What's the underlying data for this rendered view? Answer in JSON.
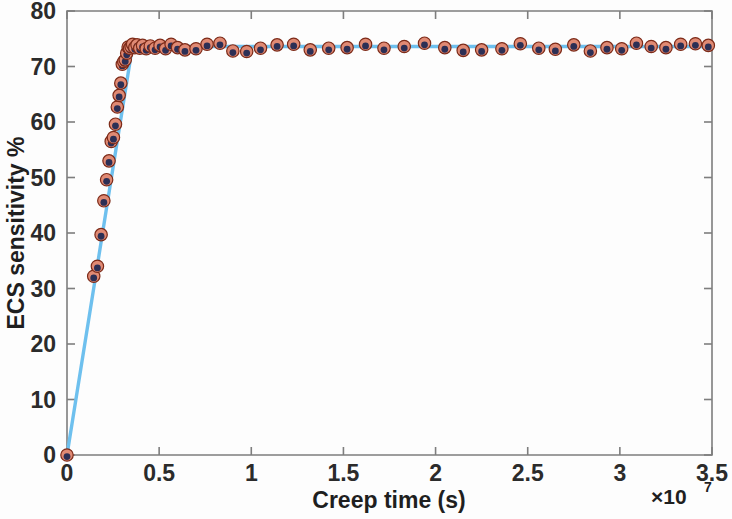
{
  "chart_data": {
    "type": "scatter",
    "title": "",
    "xlabel": "Creep time (s)",
    "ylabel": "ECS sensitivity %",
    "x_exponent_label": "×10",
    "x_exponent_value": "7",
    "x_multiplier": 10000000.0,
    "xlim": [
      0,
      3.5
    ],
    "ylim": [
      0,
      80
    ],
    "xticks": [
      0,
      0.5,
      1,
      1.5,
      2,
      2.5,
      3,
      3.5
    ],
    "xticklabels": [
      "0",
      "0.5",
      "1",
      "1.5",
      "2",
      "2.5",
      "3",
      "3.5"
    ],
    "yticks": [
      0,
      10,
      20,
      30,
      40,
      50,
      60,
      70,
      80
    ],
    "yticklabels": [
      "0",
      "10",
      "20",
      "30",
      "40",
      "50",
      "60",
      "70",
      "80"
    ],
    "grid": false,
    "legend": null,
    "colors": {
      "line": "#6ec0ee",
      "marker_outer": "#e08a74",
      "marker_outer_edge": "#7c2a18",
      "marker_inner": "#2c2f55",
      "axis": "#7e7e7e",
      "text": "#1f1f1f",
      "background": "#fdfdfd"
    },
    "series": [
      {
        "name": "ECS sensitivity vs creep time",
        "marker": "circle",
        "x": [
          0.0,
          0.145,
          0.165,
          0.185,
          0.2,
          0.215,
          0.228,
          0.24,
          0.252,
          0.263,
          0.273,
          0.283,
          0.292,
          0.3,
          0.308,
          0.316,
          0.324,
          0.332,
          0.34,
          0.348,
          0.356,
          0.368,
          0.38,
          0.395,
          0.41,
          0.43,
          0.452,
          0.478,
          0.505,
          0.535,
          0.565,
          0.6,
          0.64,
          0.7,
          0.76,
          0.83,
          0.9,
          0.975,
          1.05,
          1.14,
          1.23,
          1.32,
          1.42,
          1.52,
          1.62,
          1.72,
          1.83,
          1.94,
          2.05,
          2.15,
          2.25,
          2.36,
          2.46,
          2.56,
          2.65,
          2.75,
          2.84,
          2.93,
          3.01,
          3.09,
          3.17,
          3.25,
          3.33,
          3.41,
          3.48
        ],
        "y": [
          0.0,
          32.2,
          34.0,
          39.7,
          45.8,
          49.6,
          53.0,
          56.5,
          57.2,
          59.6,
          62.7,
          64.8,
          67.0,
          70.4,
          70.9,
          71.2,
          72.4,
          73.5,
          73.3,
          73.6,
          74.0,
          73.4,
          73.9,
          73.3,
          73.8,
          73.2,
          73.7,
          73.3,
          73.8,
          73.2,
          74.0,
          73.4,
          73.0,
          73.2,
          74.0,
          74.2,
          72.8,
          72.7,
          73.3,
          73.9,
          74.0,
          73.0,
          73.3,
          73.4,
          74.0,
          73.3,
          73.6,
          74.2,
          73.4,
          72.9,
          73.0,
          73.2,
          74.1,
          73.3,
          73.1,
          73.9,
          72.8,
          73.4,
          73.2,
          74.2,
          73.6,
          73.4,
          74.0,
          74.1,
          73.8
        ]
      }
    ],
    "fit_line": {
      "name": "bilinear fit",
      "description": "steep linear rise from origin to knee, then flat plateau",
      "x": [
        0.0,
        0.355,
        3.5
      ],
      "y": [
        0.0,
        73.6,
        73.6
      ]
    }
  }
}
